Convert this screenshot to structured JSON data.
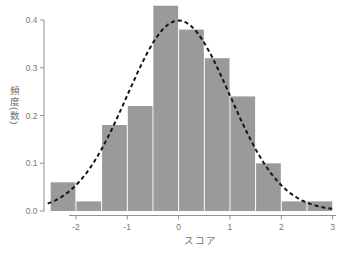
{
  "chart_data": {
    "type": "bar",
    "subtype": "histogram",
    "xlabel": "スコア",
    "ylabel": "頻度(数)",
    "bin_edges": [
      -2.5,
      -2.0,
      -1.5,
      -1.0,
      -0.5,
      0.0,
      0.5,
      1.0,
      1.5,
      2.0,
      2.5,
      3.0
    ],
    "values": [
      0.06,
      0.02,
      0.18,
      0.22,
      0.43,
      0.38,
      0.32,
      0.24,
      0.1,
      0.02,
      0.02
    ],
    "x_tick_labels": [
      "-2",
      "-1",
      "0",
      "1",
      "2",
      "3"
    ],
    "y_tick_labels": [
      "0.0",
      "0.1",
      "0.2",
      "0.3",
      "0.4"
    ],
    "xlim": [
      -2.6,
      3.1
    ],
    "ylim": [
      0,
      0.43
    ],
    "grid": "off",
    "legend": "none",
    "overlay_curve": {
      "type": "normal-density",
      "mean": 0,
      "sd": 1,
      "peak": 0.3989,
      "x_range": [
        -2.55,
        3.05
      ],
      "style": "dashed"
    },
    "colors": {
      "bar": "#9a9a9a",
      "bar_gap": "#ffffff",
      "axis": "#909090",
      "tick_label": "#787878",
      "curve": "#161616",
      "background": "#ffffff"
    }
  }
}
